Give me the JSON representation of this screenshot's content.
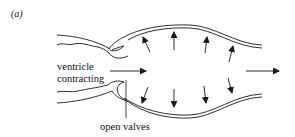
{
  "figure": {
    "panel_label": "(a)",
    "labels": {
      "ventricle_line1": "ventricle",
      "ventricle_line2": "contracting",
      "valves": "open valves"
    },
    "elements": {
      "ventricle": "contracting ventricle walls (left)",
      "valves": "two open valve flaps",
      "artery": "double-walled expanding vessel",
      "pressure_arrows": "radial arrows pointing outward on vessel walls (4 up, 4 down)",
      "flow_arrows": "horizontal arrows pointing right (2)"
    },
    "colors": {
      "line": "#1a1a1a",
      "background": "#ffffff"
    }
  }
}
